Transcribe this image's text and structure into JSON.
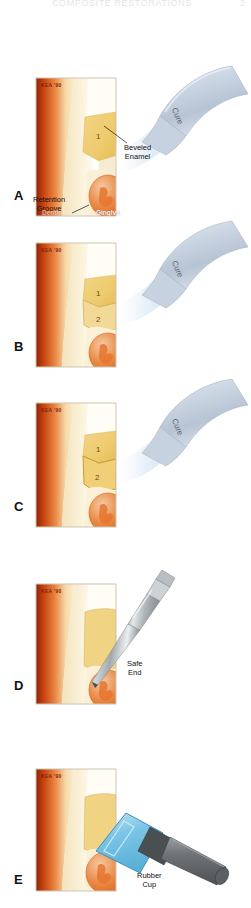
{
  "header": {
    "title": "COMPOSITE RESTORATIONS",
    "page_number": "2"
  },
  "figure": {
    "type": "medical-illustration",
    "signature_watermark": "KEA '90"
  },
  "panels": [
    {
      "letter": "A",
      "labels": [
        {
          "name": "beveled-enamel",
          "text_line1": "Beveled",
          "text_line2": "Enamel"
        },
        {
          "name": "retention-groove",
          "text_line1": "Retention",
          "text_line2": "Groove"
        },
        {
          "name": "gingiva",
          "text_line1": "Gingiva"
        },
        {
          "name": "dentin",
          "text_line1": "Dentin"
        }
      ],
      "instrument": {
        "name": "curing-light",
        "label": "Cure"
      },
      "increments": [
        "1"
      ]
    },
    {
      "letter": "B",
      "labels": [],
      "instrument": {
        "name": "curing-light",
        "label": "Cure"
      },
      "increments": [
        "1",
        "2"
      ]
    },
    {
      "letter": "C",
      "labels": [],
      "instrument": {
        "name": "curing-light",
        "label": "Cure"
      },
      "increments": [
        "1",
        "2"
      ]
    },
    {
      "letter": "D",
      "labels": [
        {
          "name": "safe-end",
          "text_line1": "Safe",
          "text_line2": "End"
        }
      ],
      "instrument": {
        "name": "finishing-bur",
        "label": "Safe End"
      },
      "increments": []
    },
    {
      "letter": "E",
      "labels": [
        {
          "name": "rubber-cup",
          "text_line1": "Rubber",
          "text_line2": "Cup"
        }
      ],
      "instrument": {
        "name": "rubber-cup-polisher",
        "label": "Rubber Cup"
      },
      "increments": []
    }
  ],
  "colors": {
    "dentin_dark": "#b8330c",
    "dentin_mid": "#e06a2a",
    "enamel": "#f7eccd",
    "enamel_light": "#fdf8ea",
    "composite": "#f0cf72",
    "composite_light": "#f7e2a3",
    "gingiva": "#e07434",
    "gingiva_light": "#f2b183",
    "light_tip": "#c9d6e6",
    "light_beam": "#cfe0f2",
    "metal": "#a8acae",
    "metal_dark": "#6d7173",
    "cup_blue": "#7ec8e8"
  }
}
